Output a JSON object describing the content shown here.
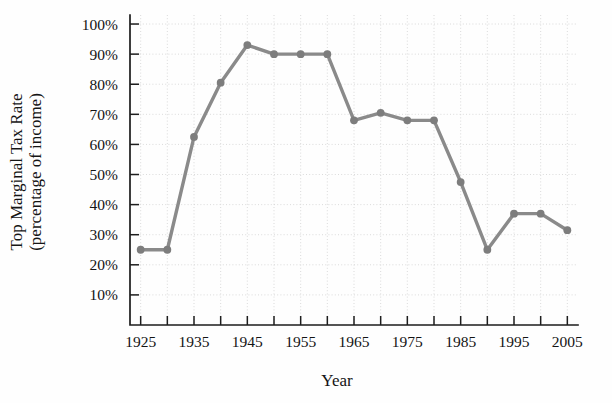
{
  "chart_data": {
    "type": "line",
    "title": "",
    "xlabel": "Year",
    "ylabel": "Top Marginal Tax Rate (percentage of income)",
    "ylabel_line1": "Top Marginal Tax Rate",
    "ylabel_line2": "(percentage of income)",
    "xlim": [
      1923,
      2007
    ],
    "ylim": [
      0,
      103
    ],
    "grid": "dotted light gray, both axes",
    "legend": "none",
    "line_color": "#8a8a8a",
    "marker_color": "#7d7d7d",
    "axis_color": "#1d1d1d",
    "grid_color": "#d7d7d7",
    "x_tick_labels": [
      "1925",
      "1935",
      "1945",
      "1955",
      "1965",
      "1975",
      "1985",
      "1995",
      "2005"
    ],
    "x_tick_values": [
      1925,
      1935,
      1945,
      1955,
      1965,
      1975,
      1985,
      1995,
      2005
    ],
    "x_minor_ticks": [
      1930,
      1940,
      1950,
      1960,
      1970,
      1980,
      1990,
      2000
    ],
    "y_tick_labels": [
      "10%",
      "20%",
      "30%",
      "40%",
      "50%",
      "60%",
      "70%",
      "80%",
      "90%",
      "100%"
    ],
    "y_tick_values": [
      10,
      20,
      30,
      40,
      50,
      60,
      70,
      80,
      90,
      100
    ],
    "x": [
      1925,
      1930,
      1935,
      1940,
      1945,
      1950,
      1955,
      1960,
      1965,
      1970,
      1975,
      1980,
      1985,
      1990,
      1995,
      2000,
      2005
    ],
    "values": [
      25,
      25,
      62.5,
      80.5,
      93,
      90,
      90,
      90,
      68,
      70.5,
      68,
      68,
      47.5,
      25,
      37,
      37,
      31.5
    ],
    "series": [
      {
        "name": "Top Marginal Tax Rate",
        "values": [
          25,
          25,
          62.5,
          80.5,
          93,
          90,
          90,
          90,
          68,
          70.5,
          68,
          68,
          47.5,
          25,
          37,
          37,
          31.5
        ]
      }
    ]
  }
}
